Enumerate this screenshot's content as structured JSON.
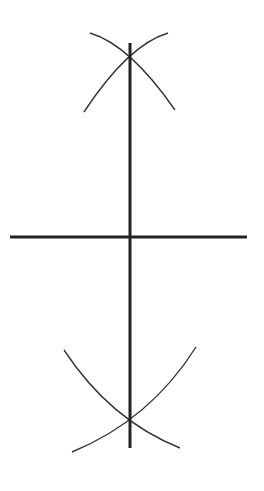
{
  "diagram": {
    "colors": {
      "background": "#ffffff",
      "stroke": "#222222"
    },
    "segment": {
      "x1": 10,
      "y1": 237,
      "x2": 247,
      "y2": 237,
      "width": 3
    },
    "bisector": {
      "x1": 130,
      "y1": 43,
      "x2": 130,
      "y2": 448,
      "width": 3
    },
    "arcs": {
      "top_left": "M 90 33 Q 130 45 175 110",
      "top_right": "M 168 33 Q 128 45 84 112",
      "bottom_left": "M 64 350 Q 110 420 180 448",
      "bottom_right": "M 196 347 Q 150 420 72 452"
    },
    "intersections": [
      {
        "name": "top",
        "x": 130,
        "y": 55
      },
      {
        "name": "bottom",
        "x": 130,
        "y": 419
      }
    ]
  }
}
